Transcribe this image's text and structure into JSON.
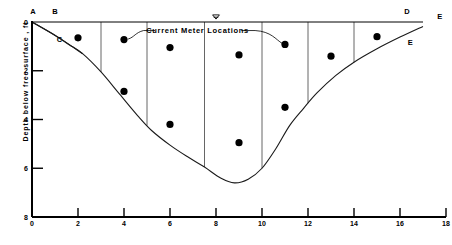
{
  "figure": {
    "ylabel": "Depth below free surface , ft",
    "annotation": "Current Meter Locations",
    "water_surface_symbol": "water-surface-triangle"
  },
  "axes": {
    "x_ticks": [
      "0",
      "2",
      "4",
      "6",
      "8",
      "10",
      "12",
      "14",
      "16",
      "18"
    ],
    "y_ticks": [
      "0",
      "2",
      "4",
      "6",
      "8"
    ]
  },
  "point_labels": {
    "a": "A",
    "b": "B",
    "c": "C",
    "d": "D",
    "e_right": "E",
    "e_lower": "E"
  },
  "colors": {
    "ink": "#000000",
    "bed_line": "#1a1a1a",
    "section_line": "#555555"
  },
  "chart_data": {
    "type": "scatter",
    "title": "",
    "xlabel": "",
    "ylabel": "Depth below free surface , ft",
    "xlim": [
      0,
      18
    ],
    "ylim": [
      8,
      0
    ],
    "y_inverted": true,
    "grid": false,
    "legend": null,
    "annotations": [
      {
        "text": "Current Meter Locations",
        "x": 7.2,
        "y": 0.35,
        "leader_to": [
          [
            4.05,
            0.72
          ],
          [
            11.05,
            0.92
          ]
        ]
      },
      {
        "text": "A",
        "x": 0.0,
        "y": -0.35
      },
      {
        "text": "B",
        "x": 1.0,
        "y": -0.35
      },
      {
        "text": "C",
        "x": 1.15,
        "y": 0.75
      },
      {
        "text": "D",
        "x": 16.3,
        "y": -0.35
      },
      {
        "text": "E",
        "x": 17.6,
        "y": -0.25
      },
      {
        "text": "E",
        "x": 16.4,
        "y": 0.85
      }
    ],
    "series": [
      {
        "name": "Current meter locations",
        "marker": "filled-circle",
        "points": [
          {
            "x": 2.0,
            "y": 0.65
          },
          {
            "x": 4.0,
            "y": 0.72
          },
          {
            "x": 4.0,
            "y": 2.85
          },
          {
            "x": 6.0,
            "y": 1.05
          },
          {
            "x": 6.0,
            "y": 4.2
          },
          {
            "x": 9.0,
            "y": 1.35
          },
          {
            "x": 9.0,
            "y": 4.95
          },
          {
            "x": 11.0,
            "y": 0.92
          },
          {
            "x": 11.0,
            "y": 3.5
          },
          {
            "x": 13.0,
            "y": 1.4
          },
          {
            "x": 15.0,
            "y": 0.6
          }
        ]
      },
      {
        "name": "Channel bed profile",
        "marker": "line",
        "points": [
          {
            "x": 0.0,
            "y": 0.0
          },
          {
            "x": 1.0,
            "y": 0.55
          },
          {
            "x": 1.6,
            "y": 0.92
          },
          {
            "x": 2.2,
            "y": 1.3
          },
          {
            "x": 3.0,
            "y": 2.05
          },
          {
            "x": 3.8,
            "y": 2.95
          },
          {
            "x": 4.6,
            "y": 3.85
          },
          {
            "x": 5.2,
            "y": 4.45
          },
          {
            "x": 6.0,
            "y": 5.05
          },
          {
            "x": 6.8,
            "y": 5.55
          },
          {
            "x": 7.5,
            "y": 5.95
          },
          {
            "x": 8.2,
            "y": 6.4
          },
          {
            "x": 8.8,
            "y": 6.6
          },
          {
            "x": 9.4,
            "y": 6.45
          },
          {
            "x": 10.0,
            "y": 6.0
          },
          {
            "x": 10.6,
            "y": 5.2
          },
          {
            "x": 11.2,
            "y": 4.25
          },
          {
            "x": 11.8,
            "y": 3.55
          },
          {
            "x": 12.4,
            "y": 2.9
          },
          {
            "x": 13.2,
            "y": 2.2
          },
          {
            "x": 14.0,
            "y": 1.65
          },
          {
            "x": 15.0,
            "y": 1.1
          },
          {
            "x": 16.0,
            "y": 0.62
          },
          {
            "x": 17.0,
            "y": 0.18
          }
        ]
      },
      {
        "name": "Bank line A-C",
        "marker": "line",
        "points": [
          {
            "x": 0.0,
            "y": 0.0
          },
          {
            "x": 1.1,
            "y": 0.6
          },
          {
            "x": 2.2,
            "y": 1.3
          }
        ]
      }
    ],
    "section_lines_x": [
      3.0,
      5.0,
      7.5,
      10.0,
      12.0,
      14.0
    ],
    "surface_line": {
      "y": 0.0,
      "x_from": 0.0,
      "x_to": 17.0
    }
  }
}
